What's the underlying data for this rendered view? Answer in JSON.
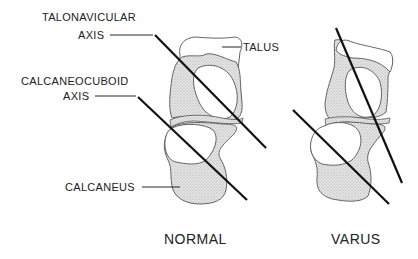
{
  "diagram": {
    "type": "anatomical-comparison",
    "panels": [
      {
        "id": "normal",
        "caption": "NORMAL",
        "labels": {
          "talonavicular_axis_line1": "TALONAVICULAR",
          "talonavicular_axis_line2": "AXIS",
          "calcaneocuboid_axis_line1": "CALCANEOCUBOID",
          "calcaneocuboid_axis_line2": "AXIS",
          "talus": "TALUS",
          "calcaneus": "CALCANEUS"
        },
        "axes_relation": "parallel"
      },
      {
        "id": "varus",
        "caption": "VARUS",
        "axes_relation": "converging"
      }
    ],
    "colors": {
      "line": "#111111",
      "outline": "#555555",
      "stipple": "#d4d4d4",
      "background": "#ffffff"
    }
  }
}
